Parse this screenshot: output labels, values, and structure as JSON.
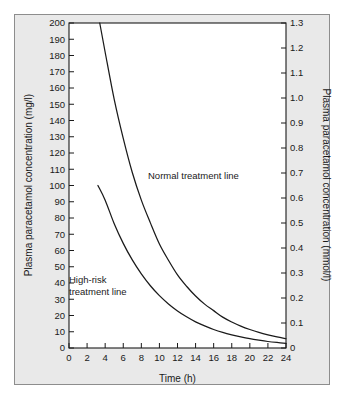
{
  "chart_data": {
    "type": "line",
    "title": "",
    "xlabel": "Time (h)",
    "ylabel": "Plasma paracetamol concentration (mg/l)",
    "ylabel_right": "Plasma paracetamol concentration (mmol/l)",
    "xlim": [
      0,
      24
    ],
    "ylim": [
      0,
      200
    ],
    "ylim_right": [
      0,
      1.3
    ],
    "grid": false,
    "legend_position": "inline-annotations",
    "xticks": [
      0,
      2,
      4,
      6,
      8,
      10,
      12,
      14,
      16,
      18,
      20,
      22,
      24
    ],
    "xtick_labels": [
      "0",
      "2",
      "4",
      "6",
      "8",
      "10",
      "12",
      "14",
      "16",
      "18",
      "20",
      "22",
      "24"
    ],
    "yticks": [
      0,
      10,
      20,
      30,
      40,
      50,
      60,
      70,
      80,
      90,
      100,
      110,
      120,
      130,
      140,
      150,
      160,
      170,
      180,
      190,
      200
    ],
    "ytick_labels": [
      "0",
      "10",
      "20",
      "30",
      "40",
      "50",
      "60",
      "70",
      "80",
      "90",
      "100",
      "110",
      "120",
      "130",
      "140",
      "150",
      "160",
      "170",
      "180",
      "190",
      "200"
    ],
    "yticks_right": [
      0,
      0.1,
      0.2,
      0.3,
      0.4,
      0.5,
      0.6,
      0.7,
      0.8,
      0.9,
      1.0,
      1.1,
      1.2,
      1.3
    ],
    "ytick_labels_right": [
      "0",
      "0.1",
      "0.2",
      "0.3",
      "0.4",
      "0.5",
      "0.6",
      "0.7",
      "0.8",
      "0.9",
      "1.0",
      "1.1",
      "1.2",
      "1.3"
    ],
    "series": [
      {
        "name": "Normal treatment line",
        "annotation": "Normal treatment line",
        "x": [
          3.4,
          4,
          5,
          6,
          7,
          8,
          9,
          10,
          11,
          12,
          13,
          14,
          15,
          16,
          17,
          18,
          19,
          20,
          21,
          22,
          23,
          24
        ],
        "values": [
          200,
          182,
          153,
          129,
          108,
          91,
          77,
          64,
          54,
          45,
          38,
          32,
          27,
          23,
          19,
          16,
          13.5,
          11.4,
          9.6,
          8.1,
          6.8,
          5.7
        ]
      },
      {
        "name": "High-risk treatment line",
        "annotation": "High-risk treatment line",
        "x": [
          3.2,
          4,
          5,
          6,
          7,
          8,
          9,
          10,
          11,
          12,
          13,
          14,
          15,
          16,
          17,
          18,
          19,
          20,
          21,
          22,
          23,
          24
        ],
        "values": [
          100,
          91,
          76.5,
          64.4,
          54.2,
          45.6,
          38.3,
          32.2,
          27.1,
          22.8,
          19.2,
          16.1,
          13.6,
          11.4,
          9.6,
          8.1,
          6.8,
          5.7,
          4.8,
          4.0,
          3.4,
          2.9
        ]
      }
    ],
    "annotations": [
      {
        "id": "normal-line-label",
        "text": "Normal treatment line",
        "lines": [
          "Normal treatment line"
        ]
      },
      {
        "id": "high-risk-line-label",
        "text": "High-risk treatment line",
        "lines": [
          "High-risk",
          "treatment line"
        ]
      }
    ]
  },
  "colors": {
    "curve": "#1a1a1a",
    "axis": "#1a1a1a",
    "panel_background": "#e9e9e9",
    "plot_background": "#ffffff",
    "panel_border": "#8d8d8d",
    "page_background": "#ffffff"
  }
}
